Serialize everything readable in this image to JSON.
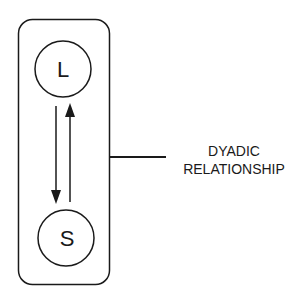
{
  "diagram": {
    "nodes": [
      {
        "id": "L",
        "label": "L"
      },
      {
        "id": "S",
        "label": "S"
      }
    ],
    "edges": [
      {
        "from": "L",
        "to": "S",
        "direction": "down"
      },
      {
        "from": "S",
        "to": "L",
        "direction": "up"
      }
    ],
    "annotation": {
      "line1": "DYADIC",
      "line2": "RELATIONSHIP"
    },
    "colors": {
      "stroke": "#1a1a1a",
      "background": "#ffffff"
    }
  }
}
